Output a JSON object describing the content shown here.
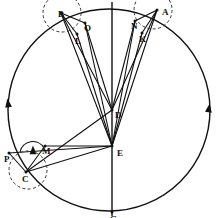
{
  "figure": {
    "background_color": "#ffffff",
    "ink_color": "#111111",
    "stroke_solid": "#111111",
    "stroke_dashed": "#333333",
    "width": 218,
    "height": 218
  },
  "deferent": {
    "name": "main-circle",
    "cx": 109,
    "cy": 110,
    "r": 101,
    "stroke": "#111111",
    "stroke_width": 1.4
  },
  "axis": {
    "name": "apsidal-line",
    "x": 112,
    "y1": 2,
    "y2": 216,
    "stroke": "#111111",
    "stroke_width": 1.4
  },
  "points": [
    {
      "id": "A",
      "label": "A",
      "x": 157,
      "y": 10,
      "lx": 162,
      "ly": 9
    },
    {
      "id": "B",
      "label": "B",
      "x": 61,
      "y": 13,
      "lx": 58,
      "ly": 11
    },
    {
      "id": "C",
      "label": "C",
      "x": 26,
      "y": 172,
      "lx": 22,
      "ly": 176
    },
    {
      "id": "D",
      "label": "D",
      "x": 112,
      "y": 110,
      "lx": 115,
      "ly": 112
    },
    {
      "id": "E",
      "label": "E",
      "x": 112,
      "y": 146,
      "lx": 117,
      "ly": 150
    },
    {
      "id": "G",
      "label": "G",
      "x": 112,
      "y": 212,
      "lx": 110,
      "ly": 216
    },
    {
      "id": "K",
      "label": "K",
      "x": 142,
      "y": 33,
      "lx": 139,
      "ly": 36
    },
    {
      "id": "L",
      "label": "L",
      "x": 77,
      "y": 34,
      "lx": 75,
      "ly": 38
    },
    {
      "id": "M",
      "label": "M",
      "x": 45,
      "y": 146,
      "lx": 42,
      "ly": 148
    },
    {
      "id": "N",
      "label": "N",
      "x": 135,
      "y": 21,
      "lx": 131,
      "ly": 23
    },
    {
      "id": "O",
      "label": "O",
      "x": 85,
      "y": 23,
      "lx": 84,
      "ly": 25
    },
    {
      "id": "P",
      "label": "P",
      "x": 9,
      "y": 153,
      "lx": 4,
      "ly": 156
    }
  ],
  "epicycles": [
    {
      "name": "epicycle-at-a",
      "cx": 153,
      "cy": 10,
      "r": 19,
      "dash": "3,2.4"
    },
    {
      "name": "epicycle-at-b",
      "cx": 62,
      "cy": 13,
      "r": 19,
      "dash": "3,2.4"
    },
    {
      "name": "epicycle-at-c",
      "cx": 28,
      "cy": 170,
      "r": 19,
      "dash": "3,2.4"
    }
  ],
  "segments": [
    {
      "name": "line-e-to-a",
      "from": "E",
      "to": "A"
    },
    {
      "name": "line-e-to-n",
      "from": "E",
      "to": "N"
    },
    {
      "name": "line-e-to-k",
      "from": "E",
      "to": "K"
    },
    {
      "name": "line-e-to-b",
      "from": "E",
      "to": "B"
    },
    {
      "name": "line-e-to-o",
      "from": "E",
      "to": "O"
    },
    {
      "name": "line-e-to-l",
      "from": "E",
      "to": "L"
    },
    {
      "name": "line-e-to-m",
      "from": "E",
      "to": "M"
    },
    {
      "name": "line-e-to-c",
      "from": "E",
      "to": "C"
    },
    {
      "name": "line-e-to-p",
      "from": "E",
      "to": "P"
    },
    {
      "name": "line-d-to-a",
      "from": "D",
      "to": "A"
    },
    {
      "name": "line-d-to-n",
      "from": "D",
      "to": "N"
    },
    {
      "name": "line-d-to-b",
      "from": "D",
      "to": "B"
    },
    {
      "name": "line-d-to-o",
      "from": "D",
      "to": "O"
    },
    {
      "name": "line-d-to-c",
      "from": "D",
      "to": "C"
    },
    {
      "name": "line-b-to-o",
      "from": "B",
      "to": "O"
    },
    {
      "name": "line-b-to-l",
      "from": "B",
      "to": "L"
    },
    {
      "name": "line-a-to-n",
      "from": "A",
      "to": "N"
    },
    {
      "name": "line-a-to-k",
      "from": "A",
      "to": "K"
    },
    {
      "name": "line-c-to-m",
      "from": "C",
      "to": "M"
    },
    {
      "name": "line-c-to-p",
      "from": "C",
      "to": "P"
    }
  ],
  "direction_markers": [
    {
      "name": "deferent-arrow-left",
      "x": 8,
      "y": 103,
      "rotation": -8
    },
    {
      "name": "deferent-arrow-right",
      "x": 209,
      "y": 108,
      "rotation": 8
    },
    {
      "name": "epicycle-arrow-c",
      "x": 33,
      "y": 150,
      "rotation": 0
    }
  ]
}
